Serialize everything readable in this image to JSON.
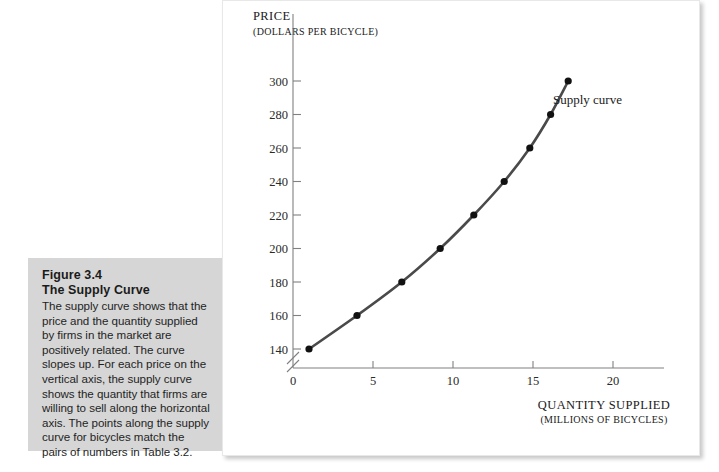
{
  "caption": {
    "figure_number": "Figure 3.4",
    "figure_title": "The Supply Curve",
    "body": "The supply curve shows that the price and the quantity supplied by firms in the market are positively related. The curve slopes up. For each price on the vertical axis, the supply curve shows the quantity that firms are willing to sell along the horizontal axis. The points along the supply curve for bicycles match the pairs of numbers in Table 3.2."
  },
  "chart_data": {
    "type": "line",
    "title": "",
    "xlabel": "QUANTITY SUPPLIED",
    "xlabel_units": "(MILLIONS OF BICYCLES)",
    "ylabel": "PRICE",
    "ylabel_units": "(DOLLARS PER BICYCLE)",
    "xlim": [
      0,
      22
    ],
    "ylim": [
      130,
      310
    ],
    "y_axis_broken": true,
    "grid": false,
    "legend_position": "inline-annotation",
    "xticks": [
      0,
      5,
      10,
      15,
      20
    ],
    "xtick_labels": [
      "0",
      "5",
      "10",
      "15",
      "20"
    ],
    "yticks": [
      140,
      160,
      180,
      200,
      220,
      240,
      260,
      280,
      300
    ],
    "ytick_labels": [
      "140",
      "160",
      "180",
      "200",
      "220",
      "240",
      "260",
      "280",
      "300"
    ],
    "series": [
      {
        "name": "Supply curve",
        "annotation": "Supply curve",
        "color": "#4a4a4a",
        "marker_color": "#111111",
        "x": [
          1.0,
          4.0,
          6.8,
          9.2,
          11.3,
          13.2,
          14.8,
          16.1,
          17.2
        ],
        "y": [
          140,
          160,
          180,
          200,
          220,
          240,
          260,
          280,
          300
        ]
      }
    ]
  }
}
